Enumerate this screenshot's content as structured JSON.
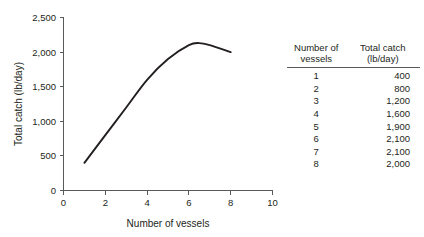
{
  "chart_data": {
    "type": "line",
    "title": "",
    "xlabel": "Number of vessels",
    "ylabel": "Total catch (lb/day)",
    "xlim": [
      0,
      10
    ],
    "ylim": [
      0,
      2500
    ],
    "xticks": [
      "0",
      "2",
      "4",
      "6",
      "8",
      "10"
    ],
    "xtick_values": [
      0,
      2,
      4,
      6,
      8,
      10
    ],
    "yticks": [
      "0",
      "500",
      "1,000",
      "1,500",
      "2,000",
      "2,500"
    ],
    "ytick_values": [
      0,
      500,
      1000,
      1500,
      2000,
      2500
    ],
    "grid": false,
    "legend": "none",
    "x": [
      1,
      2,
      3,
      4,
      5,
      6,
      7,
      8
    ],
    "values": [
      400,
      800,
      1200,
      1600,
      1900,
      2100,
      2100,
      2000
    ],
    "series": [
      {
        "name": "Total catch (lb/day)",
        "values": [
          400,
          800,
          1200,
          1600,
          1900,
          2100,
          2100,
          2000
        ],
        "color": "#231f20"
      }
    ],
    "curve_peak": {
      "x": 6.5,
      "y": 2130
    },
    "annotations": []
  },
  "table": {
    "header": {
      "col1_line1": "Number of",
      "col1_line2": "vessels",
      "col2_line1": "Total catch",
      "col2_line2": "(lb/day)"
    },
    "rows": [
      {
        "vessels": "1",
        "catch": "400"
      },
      {
        "vessels": "2",
        "catch": "800"
      },
      {
        "vessels": "3",
        "catch": "1,200"
      },
      {
        "vessels": "4",
        "catch": "1,600"
      },
      {
        "vessels": "5",
        "catch": "1,900"
      },
      {
        "vessels": "6",
        "catch": "2,100"
      },
      {
        "vessels": "7",
        "catch": "2,100"
      },
      {
        "vessels": "8",
        "catch": "2,000"
      }
    ]
  },
  "colors": {
    "curve": "#231f20",
    "axis": "#58595b",
    "text": "#231f20",
    "background": "#ffffff"
  }
}
